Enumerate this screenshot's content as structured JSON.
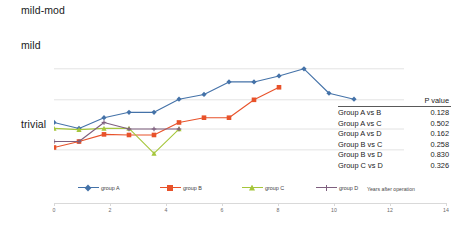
{
  "chart_data": {
    "type": "line",
    "title": "",
    "xlabel": "Years after operation",
    "ylabel": "",
    "xlim": [
      0,
      14
    ],
    "x_ticks": [
      0,
      2,
      4,
      6,
      8,
      10,
      12,
      14
    ],
    "y_ticks": [
      "trivial",
      "mild",
      "mild-mod"
    ],
    "y_tick_values": [
      1,
      2,
      3
    ],
    "ylim": [
      0.5,
      3.1
    ],
    "grid": "horizontal",
    "legend_position": "bottom",
    "series": [
      {
        "name": "group A",
        "color": "#4472a8",
        "marker": "diamond",
        "x": [
          0,
          1,
          2,
          3,
          4,
          5,
          6,
          7,
          8,
          9,
          10,
          11,
          12
        ],
        "values": [
          1.18,
          1.08,
          1.26,
          1.35,
          1.35,
          1.57,
          1.65,
          1.86,
          1.86,
          1.96,
          2.08,
          1.67,
          1.57
        ]
      },
      {
        "name": "group B",
        "color": "#e8522a",
        "marker": "square",
        "x": [
          0,
          1,
          2,
          3,
          4,
          5,
          6,
          7,
          8,
          9
        ],
        "values": [
          0.76,
          0.86,
          0.98,
          0.97,
          0.97,
          1.18,
          1.26,
          1.26,
          1.56,
          1.77
        ]
      },
      {
        "name": "group C",
        "color": "#a5c63b",
        "marker": "triangle",
        "x": [
          0,
          1,
          2,
          3,
          4,
          5
        ],
        "values": [
          1.08,
          1.06,
          1.08,
          1.08,
          0.66,
          1.07
        ]
      },
      {
        "name": "group D",
        "color": "#7e5f7e",
        "marker": "cross",
        "x": [
          0,
          1,
          2,
          3,
          4,
          5
        ],
        "values": [
          0.86,
          0.86,
          1.18,
          1.07,
          1.07,
          1.07
        ]
      }
    ]
  },
  "axis": {
    "y_labels": {
      "top": "mild-mod",
      "middle": "mild",
      "bottom": "trivial"
    },
    "x_title": "Years after operation",
    "x_ticks": [
      "0",
      "2",
      "4",
      "6",
      "8",
      "10",
      "12",
      "14"
    ]
  },
  "legend": [
    {
      "label": "group A",
      "color": "#4472a8"
    },
    {
      "label": "group B",
      "color": "#e8522a"
    },
    {
      "label": "group C",
      "color": "#a5c63b"
    },
    {
      "label": "group D",
      "color": "#7e5f7e"
    }
  ],
  "pvalue_table": {
    "header": "P value",
    "rows": [
      {
        "comparison": "Group A vs B",
        "p": "0.128"
      },
      {
        "comparison": "Group A vs C",
        "p": "0.502"
      },
      {
        "comparison": "Group A vs D",
        "p": "0.162"
      },
      {
        "comparison": "Group B vs C",
        "p": "0.258"
      },
      {
        "comparison": "Group B vs D",
        "p": "0.830"
      },
      {
        "comparison": "Group C vs D",
        "p": "0.326"
      }
    ]
  },
  "colors": {
    "gridline": "#e3e3e3",
    "axis": "#d9d9d9",
    "text": "#1a1a1a"
  }
}
